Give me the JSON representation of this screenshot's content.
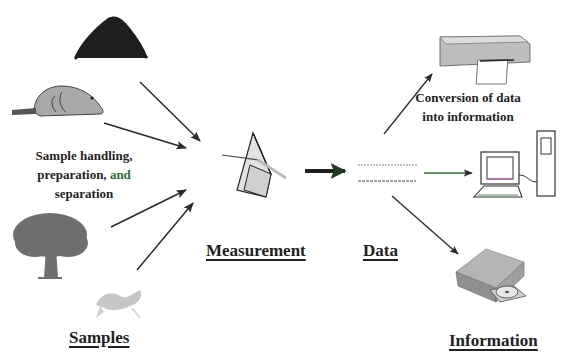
{
  "diagram": {
    "title_cropped": "",
    "stages": {
      "samples": "Samples",
      "measurement": "Measurement",
      "data": "Data",
      "information": "Information"
    },
    "notes": {
      "sample_handling_line1": "Sample handling,",
      "sample_handling_line2_a": "preparation,",
      "sample_handling_line2_b": " and",
      "sample_handling_line3": "separation",
      "conversion_line1": "Conversion of data",
      "conversion_line2": "into information"
    },
    "icons": {
      "sample_1": "soil-pile-icon",
      "sample_2": "beaver-icon",
      "sample_3": "tree-icon",
      "sample_4": "fish-icon",
      "measurement": "prism-icon",
      "info_1": "printer-icon",
      "info_2": "computer-icon",
      "info_3": "disk-drive-icon"
    },
    "colors": {
      "arrow": "#2a2a2a",
      "text": "#222222",
      "green_accent": "#2f6b2f",
      "icon_gray": "#a8a8a8",
      "soil": "#1e1e1e"
    }
  }
}
